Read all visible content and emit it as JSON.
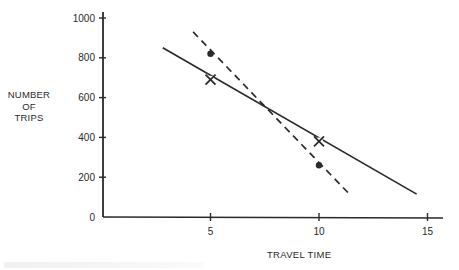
{
  "chart_data": {
    "type": "line",
    "title": "",
    "xlabel": "TRAVEL TIME",
    "ylabel_lines": [
      "NUMBER",
      "OF",
      "TRIPS"
    ],
    "ylabel": "NUMBER OF TRIPS",
    "xlim": [
      0,
      16
    ],
    "ylim": [
      0,
      1000
    ],
    "x_ticks": [
      5,
      10,
      15
    ],
    "y_ticks": [
      0,
      200,
      400,
      600,
      800,
      1000
    ],
    "grid": false,
    "legend": null,
    "series": [
      {
        "name": "solid line (observed, X markers)",
        "style": "solid",
        "marker": "x",
        "line": [
          [
            2.8,
            850
          ],
          [
            14.5,
            115
          ]
        ],
        "points": [
          [
            5,
            690
          ],
          [
            10,
            380
          ]
        ]
      },
      {
        "name": "dashed line (dot markers)",
        "style": "dashed",
        "marker": "dot",
        "line": [
          [
            4.2,
            930
          ],
          [
            11.4,
            115
          ]
        ],
        "points": [
          [
            5,
            820
          ],
          [
            10,
            260
          ]
        ]
      }
    ],
    "annotations": [
      {
        "text": "lines intersect",
        "x": 7.7,
        "y": 540
      }
    ]
  },
  "labels": {
    "ylabel_line1": "NUMBER",
    "ylabel_line2": "OF",
    "ylabel_line3": "TRIPS",
    "xlabel": "TRAVEL TIME"
  },
  "colors": {
    "ink": "#2a2a2a",
    "background": "#ffffff"
  }
}
